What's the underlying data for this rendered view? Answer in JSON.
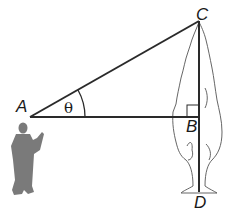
{
  "diagram": {
    "points": {
      "A": {
        "label": "A",
        "x": 30,
        "y": 117
      },
      "B": {
        "label": "B",
        "x": 199,
        "y": 117
      },
      "C": {
        "label": "C",
        "x": 199,
        "y": 21
      },
      "D": {
        "label": "D",
        "x": 199,
        "y": 192
      }
    },
    "angle_label": "θ",
    "segments": [
      "AC",
      "AB",
      "CD"
    ],
    "right_angle_at": "B",
    "figures": [
      "person-silhouette",
      "tree-outline"
    ],
    "colors": {
      "line": "#2a2a2a",
      "person": "#7a7a7a",
      "tree": "#555555"
    }
  }
}
